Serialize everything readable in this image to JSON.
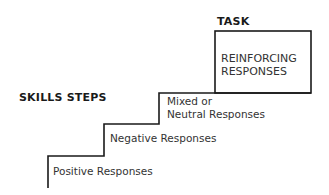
{
  "diagram": {
    "task_heading": "TASK",
    "task_box_line1": "REINFORCING",
    "task_box_line2": "RESPONSES",
    "skills_heading": "SKILLS STEPS",
    "steps": [
      {
        "line1": "Positive Responses"
      },
      {
        "line1": "Negative Responses"
      },
      {
        "line1": "Mixed or",
        "line2": "Neutral Responses"
      }
    ]
  }
}
